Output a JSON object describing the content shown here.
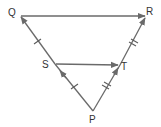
{
  "diagram": {
    "type": "triangle-midsegment",
    "stroke_color": "#6a6a6a",
    "label_color": "#333333",
    "points": {
      "Q": {
        "label": "Q",
        "x": 20,
        "y": 16
      },
      "R": {
        "label": "R",
        "x": 146,
        "y": 16
      },
      "S": {
        "label": "S",
        "x": 55,
        "y": 64
      },
      "T": {
        "label": "T",
        "x": 120,
        "y": 65
      },
      "P": {
        "label": "P",
        "x": 93,
        "y": 111
      }
    },
    "segments": [
      {
        "from": "Q",
        "to": "R",
        "arrow": "end",
        "ticks": 0
      },
      {
        "from": "S",
        "to": "T",
        "arrow": "end",
        "ticks": 0
      },
      {
        "from": "P",
        "to": "S",
        "arrow": "mid",
        "ticks": 1
      },
      {
        "from": "S",
        "to": "Q",
        "arrow": "end",
        "ticks": 1
      },
      {
        "from": "P",
        "to": "T",
        "arrow": "mid",
        "ticks": 2
      },
      {
        "from": "T",
        "to": "R",
        "arrow": "end",
        "ticks": 2
      }
    ]
  }
}
